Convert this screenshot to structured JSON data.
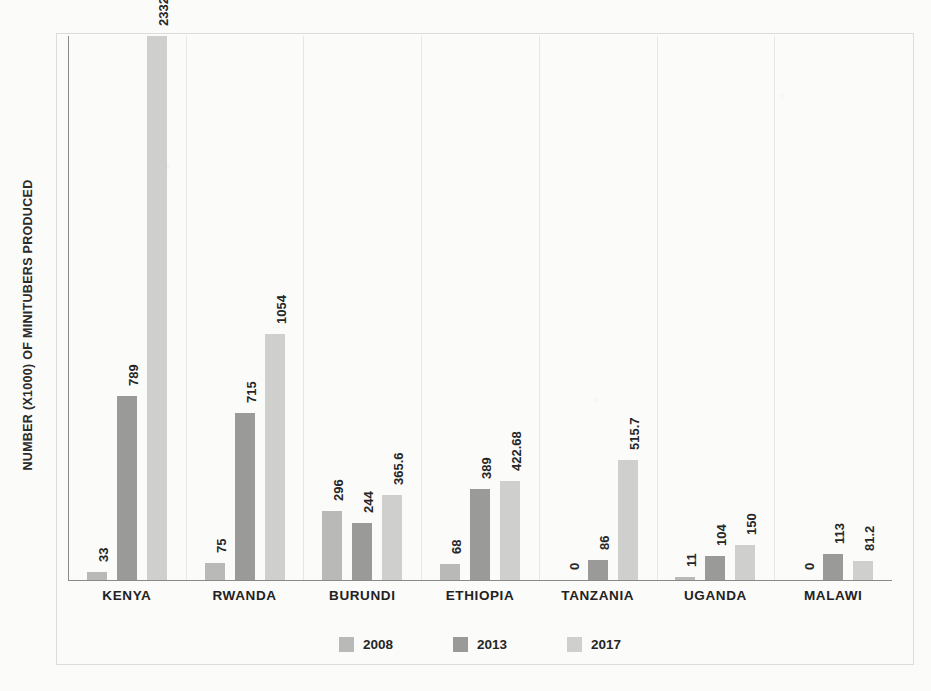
{
  "chart_data": {
    "type": "bar",
    "title": "",
    "subtitle": "",
    "xlabel": "",
    "ylabel": "NUMBER (X1000) OF MINITUBERS PRODUCED",
    "categories": [
      "KENYA",
      "RWANDA",
      "BURUNDI",
      "ETHIOPIA",
      "TANZANIA",
      "UGANDA",
      "MALAWI"
    ],
    "series": [
      {
        "name": "2008",
        "color": "#b9b9b7",
        "values": [
          33,
          75,
          296,
          68,
          0,
          11,
          0
        ]
      },
      {
        "name": "2013",
        "color": "#9a9a98",
        "values": [
          789,
          715,
          244,
          389,
          86,
          104,
          113
        ]
      },
      {
        "name": "2017",
        "color": "#cfcfcd",
        "values": [
          2332,
          1054,
          365.6,
          422.68,
          515.7,
          150,
          81.2
        ]
      }
    ],
    "data_labels": [
      [
        "33",
        "789",
        "2332"
      ],
      [
        "75",
        "715",
        "1054"
      ],
      [
        "296",
        "244",
        "365.6"
      ],
      [
        "68",
        "389",
        "422.68"
      ],
      [
        "0",
        "86",
        "515.7"
      ],
      [
        "11",
        "104",
        "150"
      ],
      [
        "0",
        "113",
        "81.2"
      ]
    ],
    "ylim": [
      0,
      2332
    ],
    "grid": "category-separators-only",
    "legend_position": "bottom",
    "legend": [
      "2008",
      "2013",
      "2017"
    ],
    "axis_color": "#8a8a88",
    "gridline_color": "#e6e6e4",
    "background_color": "#fbfbfa"
  }
}
